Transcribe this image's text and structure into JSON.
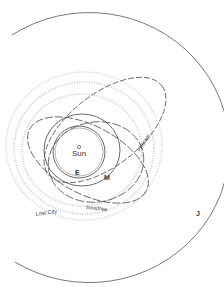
{
  "diagram": {
    "type": "orbital-diagram",
    "center": {
      "label": "Sun",
      "symbol": "sun-symbol"
    },
    "planets": [
      {
        "label": "E",
        "name": "Earth orbit"
      },
      {
        "label": "M",
        "name": "Mars orbit"
      },
      {
        "label": "J",
        "name": "Jupiter orbit"
      }
    ],
    "meteorite_orbits": [
      {
        "label": "Příbram"
      },
      {
        "label": "Lost City"
      },
      {
        "label": "Innisfree"
      }
    ],
    "asteroid_belt": {
      "description": "dotted gray bands"
    },
    "colors": {
      "line": "#555555",
      "belt": "#cccccc",
      "text": "#333333"
    }
  }
}
